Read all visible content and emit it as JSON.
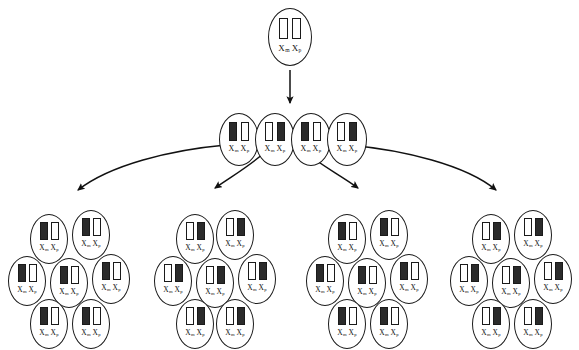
{
  "diagram": {
    "canvas": {
      "width": 579,
      "height": 350
    },
    "colors": {
      "outline": "#1a1a1a",
      "active_chromosome": "#ffffff",
      "inactive_chromosome": "#2b2b2b",
      "background": "#ffffff",
      "text": "#111111"
    },
    "genotype": {
      "maternal": "X",
      "maternal_sub": "m",
      "paternal": "X",
      "paternal_sub": "p",
      "label": "Xm Xp"
    },
    "legend_note": "Filled bar = inactivated X; open bar = active X"
  },
  "generations": [
    {
      "name": "zygote",
      "index": 0,
      "cells": [
        {
          "id": "z1",
          "x": 268,
          "y": 8,
          "size": "big",
          "left": "open",
          "right": "open"
        }
      ]
    },
    {
      "name": "early-blastocyst",
      "index": 1,
      "cells": [
        {
          "id": "b1",
          "x": 219,
          "y": 113,
          "size": "mid",
          "left": "filled",
          "right": "open"
        },
        {
          "id": "b2",
          "x": 255,
          "y": 113,
          "size": "mid",
          "left": "open",
          "right": "filled"
        },
        {
          "id": "b3",
          "x": 291,
          "y": 113,
          "size": "mid",
          "left": "filled",
          "right": "open"
        },
        {
          "id": "b4",
          "x": 327,
          "y": 113,
          "size": "mid",
          "left": "open",
          "right": "filled"
        }
      ]
    },
    {
      "name": "clones",
      "index": 2,
      "clusters": [
        {
          "id": "clone-1",
          "pattern": "maternal-inactive",
          "left": "filled",
          "right": "open",
          "cells": [
            {
              "id": "c1a",
              "x": 30,
              "y": 214
            },
            {
              "id": "c1b",
              "x": 72,
              "y": 210
            },
            {
              "id": "c1c",
              "x": 8,
              "y": 256
            },
            {
              "id": "c1d",
              "x": 50,
              "y": 258
            },
            {
              "id": "c1e",
              "x": 92,
              "y": 254
            },
            {
              "id": "c1f",
              "x": 30,
              "y": 299
            },
            {
              "id": "c1g",
              "x": 72,
              "y": 299
            }
          ]
        },
        {
          "id": "clone-2",
          "pattern": "paternal-inactive",
          "left": "open",
          "right": "filled",
          "cells": [
            {
              "id": "c2a",
              "x": 176,
              "y": 214
            },
            {
              "id": "c2b",
              "x": 216,
              "y": 210
            },
            {
              "id": "c2c",
              "x": 154,
              "y": 256
            },
            {
              "id": "c2d",
              "x": 196,
              "y": 258
            },
            {
              "id": "c2e",
              "x": 238,
              "y": 254
            },
            {
              "id": "c2f",
              "x": 176,
              "y": 299
            },
            {
              "id": "c2g",
              "x": 216,
              "y": 299
            }
          ]
        },
        {
          "id": "clone-3",
          "pattern": "maternal-inactive",
          "left": "filled",
          "right": "open",
          "cells": [
            {
              "id": "c3a",
              "x": 328,
              "y": 214
            },
            {
              "id": "c3b",
              "x": 370,
              "y": 210
            },
            {
              "id": "c3c",
              "x": 306,
              "y": 256
            },
            {
              "id": "c3d",
              "x": 348,
              "y": 258
            },
            {
              "id": "c3e",
              "x": 390,
              "y": 254
            },
            {
              "id": "c3f",
              "x": 328,
              "y": 299
            },
            {
              "id": "c3g",
              "x": 370,
              "y": 299
            }
          ]
        },
        {
          "id": "clone-4",
          "pattern": "paternal-inactive",
          "left": "open",
          "right": "filled",
          "cells": [
            {
              "id": "c4a",
              "x": 472,
              "y": 214
            },
            {
              "id": "c4b",
              "x": 514,
              "y": 210
            },
            {
              "id": "c4c",
              "x": 450,
              "y": 256
            },
            {
              "id": "c4d",
              "x": 492,
              "y": 258
            },
            {
              "id": "c4e",
              "x": 534,
              "y": 254
            },
            {
              "id": "c4f",
              "x": 472,
              "y": 299
            },
            {
              "id": "c4g",
              "x": 514,
              "y": 299
            }
          ]
        }
      ]
    }
  ],
  "arrows": [
    {
      "id": "arrow-zygote-to-blastocyst",
      "type": "straight",
      "d": "M 290 70 L 290 103"
    },
    {
      "id": "arrow-to-clone-1",
      "type": "curved",
      "d": "M 226 145 C 170 150 110 165 78 190"
    },
    {
      "id": "arrow-to-clone-2",
      "type": "curved",
      "d": "M 265 152 C 250 166 232 176 215 188"
    },
    {
      "id": "arrow-to-clone-3",
      "type": "curved",
      "d": "M 305 152 C 322 166 342 176 358 188"
    },
    {
      "id": "arrow-to-clone-4",
      "type": "curved",
      "d": "M 348 145 C 404 150 466 165 496 190"
    }
  ]
}
